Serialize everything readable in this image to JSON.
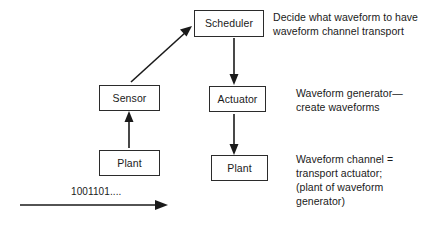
{
  "diagram": {
    "background_color": "#ffffff",
    "stroke_color": "#1a1a1a",
    "nodes": [
      {
        "id": "scheduler",
        "label": "Scheduler"
      },
      {
        "id": "sensor",
        "label": "Sensor"
      },
      {
        "id": "actuator",
        "label": "Actuator"
      },
      {
        "id": "plant_left",
        "label": "Plant"
      },
      {
        "id": "plant_right",
        "label": "Plant"
      }
    ],
    "notes": [
      {
        "id": "note_scheduler",
        "text": "Decide what waveform to have\nwaveform channel transport"
      },
      {
        "id": "note_actuator",
        "text": "Waveform generator—\ncreate waveforms"
      },
      {
        "id": "note_plant",
        "text": "Waveform channel =\ntransport actuator;\n(plant of waveform\ngenerator)"
      }
    ],
    "stream": {
      "id": "bitstream",
      "label": "1001101...."
    },
    "edges": [
      {
        "id": "sensor-to-scheduler",
        "from": "sensor",
        "to": "scheduler",
        "kind": "diagonal-arrow"
      },
      {
        "id": "scheduler-to-actuator",
        "from": "scheduler",
        "to": "actuator",
        "kind": "down-arrow"
      },
      {
        "id": "actuator-to-plant",
        "from": "actuator",
        "to": "plant_right",
        "kind": "down-arrow"
      },
      {
        "id": "plant-to-sensor",
        "from": "plant_left",
        "to": "sensor",
        "kind": "up-arrow"
      },
      {
        "id": "bitstream-arrow",
        "from": "",
        "to": "",
        "kind": "right-arrow"
      }
    ]
  }
}
